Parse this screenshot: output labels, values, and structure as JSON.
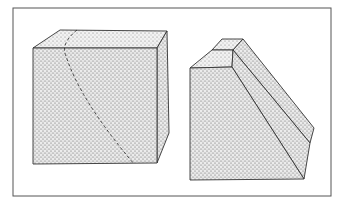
{
  "figure": {
    "colors": {
      "background": "#ffffff",
      "frame": "#555555",
      "stipple_fill": "#c9c9c9",
      "stipple_dark": "#b8b8b8",
      "edge": "#333333"
    },
    "objects": [
      {
        "name": "cube",
        "feature": "dashed curved line"
      },
      {
        "name": "beveled wedge",
        "feature": "two chamfer faces"
      }
    ]
  }
}
